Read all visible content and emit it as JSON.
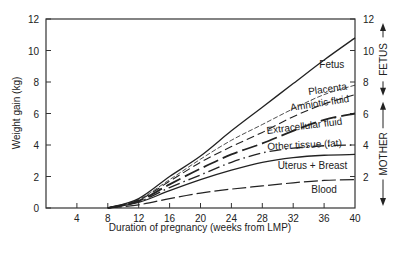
{
  "chart_data": {
    "type": "area",
    "title": "",
    "xlabel": "Duration of pregnancy (weeks from LMP)",
    "ylabel": "Weight gain (kg)",
    "xlim": [
      0,
      40
    ],
    "ylim": [
      0,
      12
    ],
    "xticks": [
      4,
      8,
      12,
      16,
      20,
      24,
      28,
      32,
      36,
      40
    ],
    "yticks": [
      0,
      2,
      4,
      6,
      8,
      10,
      12
    ],
    "right_yticks": [
      2,
      4,
      6,
      8,
      10,
      12
    ],
    "grid": false,
    "stacking": "cumulative",
    "x": [
      8,
      12,
      16,
      20,
      24,
      28,
      32,
      36,
      40
    ],
    "series": [
      {
        "name": "Blood",
        "style": "long-dash",
        "values": [
          0,
          0.2,
          0.6,
          0.95,
          1.2,
          1.4,
          1.6,
          1.75,
          1.8
        ]
      },
      {
        "name": "Uterus + Breast",
        "style": "solid",
        "values": [
          0,
          0.35,
          1.1,
          1.8,
          2.4,
          2.9,
          3.2,
          3.35,
          3.4
        ]
      },
      {
        "name": "Other tissue (fat)",
        "style": "dash-dot",
        "values": [
          0,
          0.4,
          1.3,
          2.1,
          2.9,
          3.5,
          3.8,
          3.95,
          4.0
        ]
      },
      {
        "name": "Extracellular fluid",
        "style": "long-dash-bold",
        "values": [
          0,
          0.45,
          1.5,
          2.5,
          3.4,
          4.1,
          4.9,
          5.6,
          6.0
        ]
      },
      {
        "name": "Amniotic fluid",
        "style": "dash",
        "values": [
          0,
          0.5,
          1.7,
          2.9,
          3.9,
          4.8,
          5.8,
          6.6,
          7.2
        ]
      },
      {
        "name": "Placenta",
        "style": "thin-dash",
        "values": [
          0,
          0.55,
          1.8,
          3.1,
          4.3,
          5.3,
          6.3,
          7.2,
          7.8
        ]
      },
      {
        "name": "Fetus",
        "style": "solid",
        "values": [
          0,
          0.6,
          2.0,
          3.3,
          4.9,
          6.4,
          7.9,
          9.4,
          10.8
        ]
      }
    ],
    "band_labels": [
      {
        "text": "Fetus",
        "x": 37,
        "y": 8.9
      },
      {
        "text": "Placenta",
        "x": 36.5,
        "y": 7.35,
        "rotate": -8
      },
      {
        "text": "Amniotic fluid",
        "x": 35.5,
        "y": 6.45,
        "rotate": -9
      },
      {
        "text": "Extracellular fluid",
        "x": 33.5,
        "y": 5.0,
        "rotate": -7
      },
      {
        "text": "Other tissue (fat)",
        "x": 33.5,
        "y": 3.8,
        "rotate": -3
      },
      {
        "text": "Uterus + Breast",
        "x": 34.5,
        "y": 2.45
      },
      {
        "text": "Blood",
        "x": 36,
        "y": 0.95
      }
    ],
    "right_annotations": [
      {
        "text": "FETUS",
        "range": [
          7.0,
          12
        ]
      },
      {
        "text": "MOTHER",
        "range": [
          0,
          7.0
        ]
      }
    ]
  }
}
